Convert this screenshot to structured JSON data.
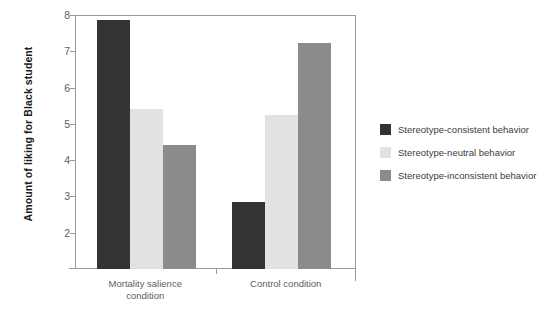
{
  "chart_data": {
    "type": "bar",
    "title": "",
    "subtitle": "",
    "xlabel": "",
    "ylabel": "Amount of liking for Black student",
    "categories": [
      "Mortality salience condition",
      "Control condition"
    ],
    "category_lines": [
      [
        "Mortality salience",
        "condition"
      ],
      [
        "Control condition"
      ]
    ],
    "series": [
      {
        "name": "Stereotype-consistent behavior",
        "color": "#333333",
        "values": [
          7.85,
          2.85
        ]
      },
      {
        "name": "Stereotype-neutral behavior",
        "color": "#e2e2e2",
        "values": [
          5.42,
          5.25
        ]
      },
      {
        "name": "Stereotype-inconsistent behavior",
        "color": "#8b8b8b",
        "values": [
          4.42,
          7.22
        ]
      }
    ],
    "ylim": [
      1,
      8
    ],
    "yticks": [
      2,
      3,
      4,
      5,
      6,
      7,
      8
    ],
    "ytick_labels": [
      "2",
      "3",
      "4",
      "5",
      "6",
      "7",
      "8"
    ],
    "grid": false,
    "legend_position": "right"
  },
  "legend": {
    "items": [
      {
        "label": "Stereotype-consistent behavior",
        "color": "#333333"
      },
      {
        "label": "Stereotype-neutral behavior",
        "color": "#e2e2e2"
      },
      {
        "label": "Stereotype-inconsistent behavior",
        "color": "#8b8b8b"
      }
    ]
  },
  "axes": {
    "y_title": "Amount of liking for Black student",
    "y_tick_labels": [
      "8",
      "7",
      "6",
      "5",
      "4",
      "3",
      "2"
    ],
    "x_group_labels": [
      {
        "line1": "Mortality salience",
        "line2": "condition"
      },
      {
        "line1": "Control condition",
        "line2": ""
      }
    ]
  },
  "colors": {
    "axis": "#9a9a9a",
    "tick_text": "#5d5d5d",
    "title_text": "#1c1c1c",
    "background": "#ffffff"
  }
}
